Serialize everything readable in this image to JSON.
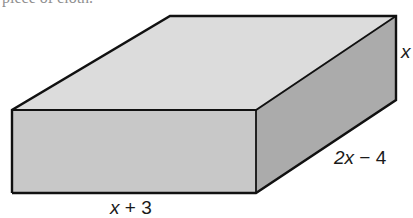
{
  "cut_text": "piece of cloth.",
  "figure": {
    "type": "rectangular prism",
    "faces": {
      "top": {
        "color": "#dcdcdc"
      },
      "front": {
        "color": "#c9c9c9"
      },
      "side": {
        "color": "#adadad"
      }
    },
    "edge_color": "#111111"
  },
  "labels": {
    "height": {
      "var": "x",
      "rest": ""
    },
    "depth": {
      "var": "2x",
      "rest": " − 4"
    },
    "width": {
      "var": "x",
      "rest": " + 3"
    }
  }
}
